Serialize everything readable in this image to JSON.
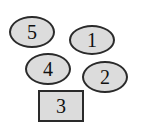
{
  "diagram": {
    "shapes": [
      {
        "label": "5",
        "type": "ellipse"
      },
      {
        "label": "1",
        "type": "ellipse"
      },
      {
        "label": "4",
        "type": "ellipse"
      },
      {
        "label": "2",
        "type": "ellipse"
      },
      {
        "label": "3",
        "type": "rectangle"
      }
    ],
    "colors": {
      "fill": "#dcdcdc",
      "stroke": "#2a2a2a",
      "background": "#ffffff"
    }
  }
}
